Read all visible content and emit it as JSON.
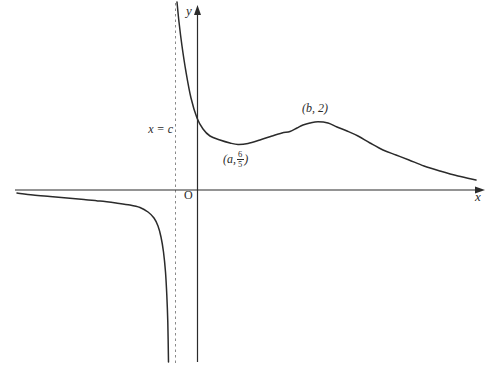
{
  "figure": {
    "background": "#ffffff",
    "ink_color": "#2b2b2b",
    "asymptote_color": "#8a8a8a"
  },
  "labels": {
    "y_axis": "y",
    "x_axis": "x",
    "origin": "O",
    "asymptote": "x = c",
    "local_min": {
      "prefix": "(a, ",
      "numerator": "6",
      "denominator": "5",
      "suffix": ")"
    },
    "local_max": "(b, 2)"
  },
  "chart_data": {
    "type": "line",
    "title": "",
    "xlabel": "x",
    "ylabel": "y",
    "grid": false,
    "legend": false,
    "x_tick_labels": [],
    "y_tick_labels": [],
    "features": {
      "vertical_asymptote_label": "x = c",
      "vertical_asymptote_position": "c < 0, just left of the y-axis",
      "horizontal_asymptote": "y = 0 (the x-axis) as x → −∞ and x → +∞",
      "left_branch_behavior": "approaches y = 0 from below as x → −∞; falls to −∞ as x → c⁻",
      "right_branch_behavior": "comes down from +∞ as x → c⁺; local minimum at (a, 6/5); local maximum at (b, 2); decays toward y = 0⁺",
      "local_minimum": {
        "x": "a",
        "y": "6/5"
      },
      "local_maximum": {
        "x": "b",
        "y": "2"
      }
    },
    "series": [
      {
        "name": "left-branch",
        "points_px": [
          [
            17,
            193
          ],
          [
            33,
            195
          ],
          [
            50,
            196.5
          ],
          [
            67,
            198
          ],
          [
            84,
            199.5
          ],
          [
            100,
            201
          ],
          [
            116,
            203
          ],
          [
            130,
            205
          ],
          [
            140,
            207.5
          ],
          [
            148,
            212
          ],
          [
            154,
            218
          ],
          [
            158,
            226
          ],
          [
            161,
            237
          ],
          [
            163.5,
            252
          ],
          [
            165.5,
            272
          ],
          [
            166.8,
            295
          ],
          [
            167.8,
            322
          ],
          [
            168.5,
            362
          ]
        ]
      },
      {
        "name": "right-branch",
        "points_px": [
          [
            177,
            2
          ],
          [
            179,
            22
          ],
          [
            182,
            46
          ],
          [
            186,
            72
          ],
          [
            191,
            98
          ],
          [
            197,
            118
          ],
          [
            203,
            129
          ],
          [
            210,
            136
          ],
          [
            220,
            140
          ],
          [
            230,
            143
          ],
          [
            238,
            144.5
          ],
          [
            248,
            143.5
          ],
          [
            260,
            140
          ],
          [
            272,
            136
          ],
          [
            282,
            133
          ],
          [
            290,
            131.5
          ],
          [
            297,
            128
          ],
          [
            303,
            125
          ],
          [
            310,
            123
          ],
          [
            318,
            121.8
          ],
          [
            328,
            123
          ],
          [
            337,
            127
          ],
          [
            347,
            131
          ],
          [
            358,
            136
          ],
          [
            370,
            143
          ],
          [
            383,
            150
          ],
          [
            396,
            155
          ],
          [
            409,
            160
          ],
          [
            424,
            166
          ],
          [
            440,
            171
          ],
          [
            458,
            176
          ],
          [
            476,
            180
          ]
        ]
      }
    ]
  }
}
